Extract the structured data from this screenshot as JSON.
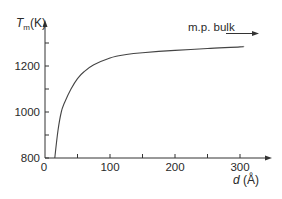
{
  "chart_data": {
    "type": "line",
    "title": "",
    "ylabel": "T_m(K)",
    "ylabel_main": "T",
    "ylabel_sub": "m",
    "ylabel_unit": "(K)",
    "xlabel": "d (Å)",
    "xlabel_var": "d",
    "xlabel_unit": " (Å)",
    "xlim": [
      0,
      330
    ],
    "ylim": [
      800,
      1340
    ],
    "x_ticks": [
      0,
      100,
      200,
      300
    ],
    "x_tick_labels": [
      "0",
      "100",
      "200",
      "300"
    ],
    "x_minor_ticks": [
      50,
      150,
      250
    ],
    "y_ticks": [
      800,
      1000,
      1200
    ],
    "y_tick_labels": [
      "800",
      "1000",
      "1200"
    ],
    "y_minor_ticks": [
      900,
      1100,
      1300
    ],
    "grid": false,
    "legend": null,
    "annotations": [
      {
        "text": "m.p. bulk",
        "arrow": "right",
        "meaning": "approaches bulk melting point"
      }
    ],
    "series": [
      {
        "name": "T_m vs d",
        "x": [
          15,
          20,
          25,
          30,
          40,
          50,
          60,
          75,
          100,
          125,
          150,
          200,
          250,
          300,
          305
        ],
        "y": [
          800,
          920,
          1000,
          1040,
          1100,
          1145,
          1175,
          1205,
          1235,
          1250,
          1258,
          1268,
          1276,
          1283,
          1285
        ]
      }
    ]
  },
  "labels": {
    "annotation": "m.p. bulk"
  },
  "style": {
    "axis_color": "#333333",
    "curve_color": "#444444",
    "text_color": "#2a2a2a"
  }
}
